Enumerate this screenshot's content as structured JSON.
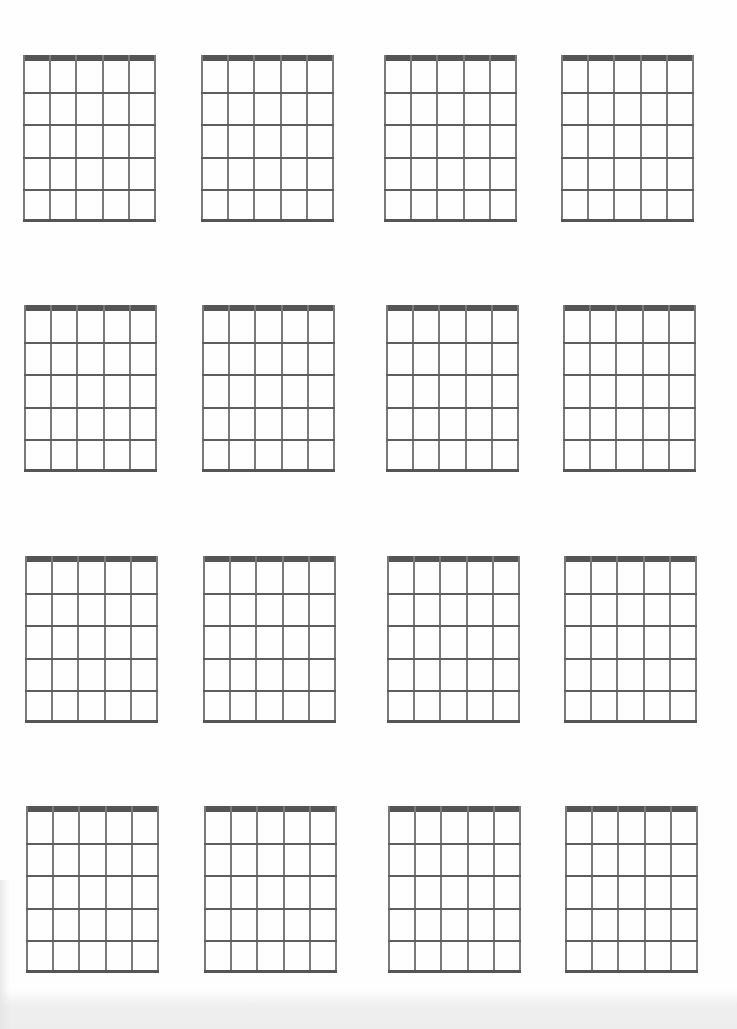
{
  "sheet": {
    "title": "",
    "description": "Blank guitar chord diagram sheet",
    "grid_rows": 4,
    "grid_cols": 4,
    "diagram": {
      "strings": 6,
      "frets": 5,
      "nut_color": "#555555",
      "string_color": "#7a7a7a",
      "fret_color": "#5e5e5e"
    },
    "diagrams": [
      {
        "row": 1,
        "col": 1,
        "x": 23,
        "y": 55
      },
      {
        "row": 1,
        "col": 2,
        "x": 201,
        "y": 55
      },
      {
        "row": 1,
        "col": 3,
        "x": 384,
        "y": 55
      },
      {
        "row": 1,
        "col": 4,
        "x": 561,
        "y": 55
      },
      {
        "row": 2,
        "col": 1,
        "x": 24,
        "y": 305
      },
      {
        "row": 2,
        "col": 2,
        "x": 202,
        "y": 305
      },
      {
        "row": 2,
        "col": 3,
        "x": 386,
        "y": 305
      },
      {
        "row": 2,
        "col": 4,
        "x": 563,
        "y": 305
      },
      {
        "row": 3,
        "col": 1,
        "x": 25,
        "y": 556
      },
      {
        "row": 3,
        "col": 2,
        "x": 203,
        "y": 556
      },
      {
        "row": 3,
        "col": 3,
        "x": 387,
        "y": 556
      },
      {
        "row": 3,
        "col": 4,
        "x": 564,
        "y": 556
      },
      {
        "row": 4,
        "col": 1,
        "x": 26,
        "y": 806
      },
      {
        "row": 4,
        "col": 2,
        "x": 204,
        "y": 806
      },
      {
        "row": 4,
        "col": 3,
        "x": 388,
        "y": 806
      },
      {
        "row": 4,
        "col": 4,
        "x": 565,
        "y": 806
      }
    ]
  }
}
